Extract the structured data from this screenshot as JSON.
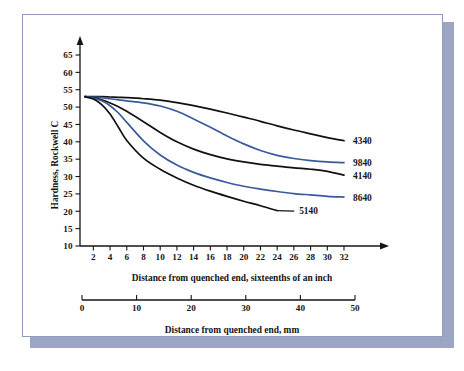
{
  "figure": {
    "frame_border_color": "#8e9cbe",
    "shadow_color": "#9aa6c4",
    "background": "#ffffff"
  },
  "chart_data": {
    "type": "line",
    "title": "",
    "xlabel": "Distance from quenched end, sixteenths of an inch",
    "ylabel": "Hardness, Rockwell C",
    "secondary_xlabel": "Distance from quenched end, mm",
    "xlim": [
      0,
      33
    ],
    "ylim": [
      10,
      67
    ],
    "xticks": [
      2,
      4,
      6,
      8,
      10,
      12,
      14,
      16,
      18,
      20,
      22,
      24,
      26,
      28,
      30,
      32
    ],
    "yticks": [
      10,
      15,
      20,
      25,
      30,
      35,
      40,
      45,
      50,
      55,
      60,
      65
    ],
    "secondary_xticks": [
      0,
      10,
      20,
      30,
      40,
      50
    ],
    "secondary_xlim": [
      0,
      50
    ],
    "grid": false,
    "legend_position": "right-of-curve-ends",
    "series": [
      {
        "name": "4340",
        "color": "#111111",
        "label_color": "#171717",
        "x": [
          1,
          2,
          3,
          4,
          5,
          6,
          8,
          10,
          12,
          14,
          16,
          18,
          20,
          22,
          24,
          26,
          28,
          30,
          32
        ],
        "y": [
          53,
          53,
          53,
          52.9,
          52.8,
          52.7,
          52.4,
          52.0,
          51.3,
          50.4,
          49.4,
          48.3,
          47.1,
          45.9,
          44.6,
          43.4,
          42.3,
          41.2,
          40.3
        ]
      },
      {
        "name": "9840",
        "color": "#3a5a9c",
        "label_color": "#171717",
        "x": [
          1,
          2,
          3,
          4,
          5,
          6,
          8,
          10,
          12,
          14,
          16,
          18,
          20,
          22,
          24,
          26,
          28,
          30,
          32
        ],
        "y": [
          53,
          52.9,
          52.7,
          52.4,
          52.1,
          51.8,
          51.2,
          50.3,
          48.8,
          46.6,
          44.2,
          41.7,
          39.4,
          37.5,
          36.1,
          35.2,
          34.6,
          34.2,
          34.0
        ]
      },
      {
        "name": "4140",
        "color": "#111111",
        "label_color": "#171717",
        "x": [
          1,
          2,
          3,
          4,
          5,
          6,
          8,
          10,
          12,
          14,
          16,
          18,
          20,
          22,
          24,
          26,
          28,
          30,
          32
        ],
        "y": [
          53,
          52.7,
          52.1,
          51.2,
          50.1,
          48.8,
          45.8,
          42.7,
          40.0,
          37.9,
          36.3,
          35.1,
          34.2,
          33.5,
          33.0,
          32.5,
          32.1,
          31.5,
          30.4
        ]
      },
      {
        "name": "8640",
        "color": "#3a5a9c",
        "label_color": "#171717",
        "x": [
          1,
          2,
          3,
          4,
          5,
          6,
          8,
          10,
          12,
          14,
          16,
          18,
          20,
          22,
          24,
          26,
          28,
          30,
          32
        ],
        "y": [
          53,
          52.6,
          51.8,
          50.4,
          48.3,
          45.6,
          40.3,
          36.2,
          33.3,
          31.2,
          29.6,
          28.3,
          27.2,
          26.4,
          25.7,
          25.1,
          24.7,
          24.3,
          24.1
        ]
      },
      {
        "name": "5140",
        "color": "#111111",
        "label_color": "#171717",
        "x": [
          1,
          2,
          3,
          4,
          5,
          6,
          8,
          10,
          12,
          14,
          16,
          18,
          20,
          22,
          24
        ],
        "y": [
          53,
          52.3,
          50.7,
          48.0,
          44.2,
          40.4,
          35.3,
          32.1,
          29.6,
          27.5,
          25.8,
          24.3,
          22.9,
          21.6,
          20.2
        ]
      }
    ]
  }
}
